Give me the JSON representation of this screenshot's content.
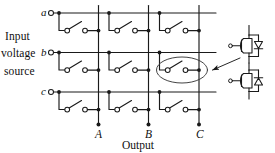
{
  "figure": {
    "source_label": {
      "line1": "Input",
      "line2": "voltage",
      "line3": "source"
    },
    "output_label": "Output",
    "input_terminals": [
      {
        "id": "a",
        "label": "a"
      },
      {
        "id": "b",
        "label": "b"
      },
      {
        "id": "c",
        "label": "c"
      }
    ],
    "output_columns": [
      {
        "id": "A",
        "label": "A"
      },
      {
        "id": "B",
        "label": "B"
      },
      {
        "id": "C",
        "label": "C"
      }
    ],
    "switch_count": 9,
    "highlighted_switch": {
      "row": "b",
      "column": "C",
      "callout": "bidirectional-switch-detail"
    },
    "detail": {
      "name": "common-emitter bidirectional switch",
      "devices": [
        {
          "type": "igbt",
          "position": "upper",
          "orientation": "emitter-down"
        },
        {
          "type": "igbt",
          "position": "lower",
          "orientation": "emitter-up"
        }
      ],
      "diodes": [
        {
          "type": "anti-parallel-diode",
          "position": "upper"
        },
        {
          "type": "anti-parallel-diode",
          "position": "lower"
        }
      ]
    },
    "colors": {
      "line": "#1a1a1a",
      "text": "#101010",
      "background": "#ffffff",
      "highlight_ellipse": "#3a3a3a"
    }
  }
}
